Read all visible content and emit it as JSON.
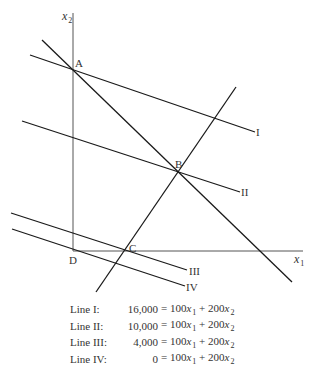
{
  "axes": {
    "x_label": "x",
    "x_sub": "1",
    "y_label": "x",
    "y_sub": "2"
  },
  "points": {
    "A": "A",
    "B": "B",
    "C": "C",
    "D": "D"
  },
  "line_labels": {
    "I": "I",
    "II": "II",
    "III": "III",
    "IV": "IV"
  },
  "equations": [
    {
      "name": "Line I:",
      "lhs": "16,000",
      "eq": "= 100",
      "v1": "x",
      "s1": "1",
      "plus": " + 200",
      "v2": "x",
      "s2": "2"
    },
    {
      "name": "Line II:",
      "lhs": "10,000",
      "eq": "= 100",
      "v1": "x",
      "s1": "1",
      "plus": " + 200",
      "v2": "x",
      "s2": "2"
    },
    {
      "name": "Line III:",
      "lhs": "4,000",
      "eq": "= 100",
      "v1": "x",
      "s1": "1",
      "plus": " + 200",
      "v2": "x",
      "s2": "2"
    },
    {
      "name": "Line IV:",
      "lhs": "0",
      "eq": "= 100",
      "v1": "x",
      "s1": "1",
      "plus": " + 200",
      "v2": "x",
      "s2": "2"
    }
  ],
  "colors": {
    "line": "#1a1a1a",
    "axis": "#555555"
  }
}
